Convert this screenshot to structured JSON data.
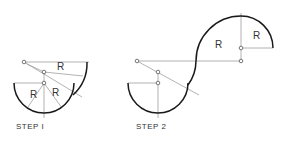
{
  "diagram": {
    "type": "geometric construction",
    "colors": {
      "arc": "#1a1a1a",
      "construction_line": "#9a9a9a",
      "point": "#555555",
      "text": "#333333"
    },
    "steps": [
      {
        "label": "STEP I",
        "radius_labels": [
          "R",
          "R",
          "R"
        ]
      },
      {
        "label": "STEP 2",
        "radius_labels": [
          "R",
          "R"
        ]
      }
    ]
  }
}
